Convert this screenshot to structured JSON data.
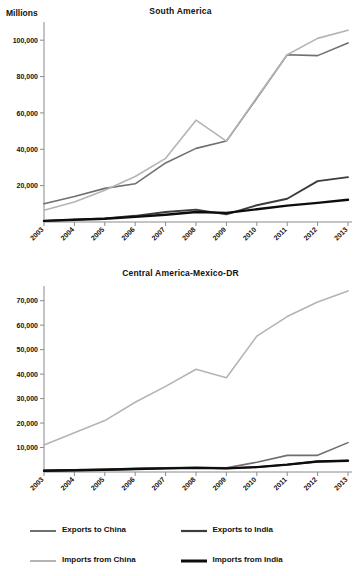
{
  "units_label": "Millions",
  "colors": {
    "exports_china": "#6f6f6f",
    "imports_china": "#b4b4b4",
    "exports_india": "#3c3c3c",
    "imports_india": "#0d0d0d",
    "axis": "#8a8a8a",
    "text": "#111111"
  },
  "legend": {
    "items": [
      {
        "label": "Exports to China",
        "color": "#6f6f6f",
        "width": 2.0,
        "name": "exports-to-china"
      },
      {
        "label": "Exports to India",
        "color": "#3c3c3c",
        "width": 2.2,
        "name": "exports-to-india"
      },
      {
        "label": "Imports from China",
        "color": "#b4b4b4",
        "width": 2.0,
        "name": "imports-from-china"
      },
      {
        "label": "Imports from India",
        "color": "#0d0d0d",
        "width": 3.0,
        "name": "imports-from-india"
      }
    ]
  },
  "chart_data": [
    {
      "type": "line",
      "title": "South America",
      "xlabel": "",
      "ylabel": "Millions",
      "grid": false,
      "legend_position": "bottom",
      "x": [
        "2003",
        "2004",
        "2005",
        "2006",
        "2007",
        "2008",
        "2009",
        "2010",
        "2011",
        "2012",
        "2013"
      ],
      "ylim": [
        0,
        110000
      ],
      "yticks": [
        20000,
        40000,
        60000,
        80000,
        100000
      ],
      "ytick_labels": [
        "20,000",
        "40,000",
        "60,000",
        "80,000",
        "100,000"
      ],
      "series": [
        {
          "name": "Exports to China",
          "color": "#6f6f6f",
          "values": [
            10000,
            14000,
            18500,
            21000,
            32500,
            40500,
            44500,
            68000,
            92000,
            91500,
            98500
          ]
        },
        {
          "name": "Imports from China",
          "color": "#b4b4b4",
          "values": [
            6500,
            11000,
            17500,
            25000,
            35000,
            56000,
            44500,
            68500,
            92000,
            101000,
            105500
          ]
        },
        {
          "name": "Exports to India",
          "color": "#3c3c3c",
          "values": [
            600,
            1300,
            2000,
            3400,
            5500,
            6800,
            4200,
            9200,
            12800,
            13500,
            22500
          ]
        },
        {
          "name": "Imports from India",
          "color": "#0d0d0d",
          "values": [
            600,
            1200,
            1800,
            2800,
            4000,
            5500,
            5000,
            7000,
            9000,
            10500,
            12200
          ]
        }
      ],
      "series_end_override": {
        "Exports to India": [
          600,
          1300,
          2000,
          3400,
          5500,
          6800,
          4200,
          9200,
          12800,
          22500,
          24700
        ]
      }
    },
    {
      "type": "line",
      "title": "Central America-Mexico-DR",
      "xlabel": "",
      "ylabel": "",
      "grid": false,
      "legend_position": "bottom",
      "x": [
        "2003",
        "2004",
        "2005",
        "2006",
        "2007",
        "2008",
        "2009",
        "2010",
        "2011",
        "2012",
        "2013"
      ],
      "ylim": [
        0,
        76000
      ],
      "yticks": [
        10000,
        20000,
        30000,
        40000,
        50000,
        60000,
        70000
      ],
      "ytick_labels": [
        "10,000",
        "20,000",
        "30,000",
        "40,000",
        "50,000",
        "60,000",
        "70,000"
      ],
      "series": [
        {
          "name": "Imports from China",
          "color": "#b4b4b4",
          "values": [
            11000,
            16000,
            21000,
            28500,
            35000,
            42000,
            38500,
            55500,
            63500,
            69500,
            74000
          ]
        },
        {
          "name": "Exports to China",
          "color": "#6f6f6f",
          "values": [
            700,
            900,
            1100,
            1500,
            1700,
            1900,
            1700,
            4000,
            6800,
            6800,
            12000
          ]
        },
        {
          "name": "Exports to India",
          "color": "#3c3c3c",
          "values": [
            500,
            700,
            900,
            1200,
            1500,
            1700,
            1500,
            2000,
            3000,
            4300,
            4600
          ]
        },
        {
          "name": "Imports from India",
          "color": "#0d0d0d",
          "values": [
            500,
            700,
            900,
            1200,
            1500,
            1700,
            1500,
            2000,
            3000,
            4300,
            4600
          ]
        }
      ]
    }
  ]
}
